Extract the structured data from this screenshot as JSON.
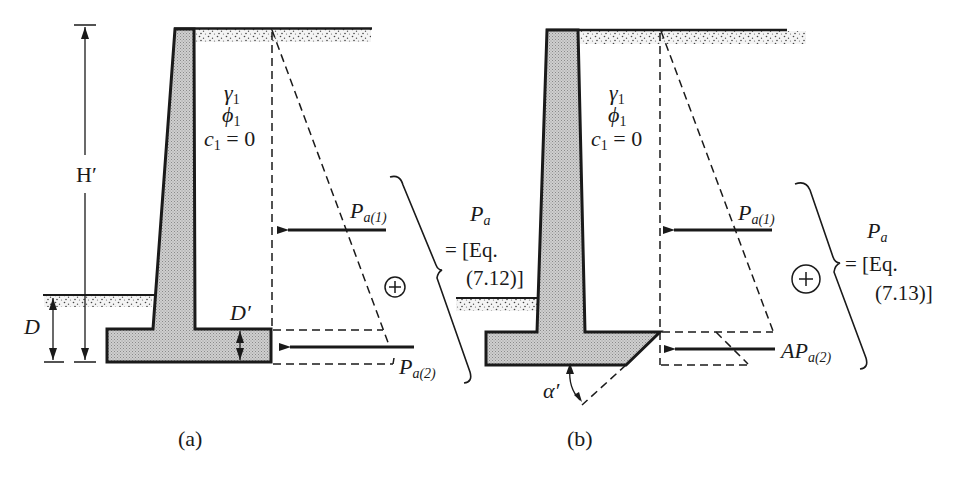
{
  "figure": {
    "panels": [
      {
        "id": "a",
        "caption": "(a)",
        "soil": {
          "gamma": "γ",
          "gamma_sub": "1",
          "phi": "ϕ",
          "phi_sub": "1",
          "c": "c",
          "c_sub": "1",
          "c_value": "= 0"
        },
        "dimensions": {
          "height": "H′",
          "depth": "D",
          "footing_thickness": "D′"
        },
        "forces": [
          {
            "label": "P",
            "sub": "a(1)"
          },
          {
            "label": "P",
            "sub": "a(2)"
          }
        ],
        "sum_symbol": "+",
        "result": {
          "label": "P",
          "sub": "a",
          "eq_line1": "= [Eq.",
          "eq_line2": "(7.12)]"
        }
      },
      {
        "id": "b",
        "caption": "(b)",
        "soil": {
          "gamma": "γ",
          "gamma_sub": "1",
          "phi": "ϕ",
          "phi_sub": "1",
          "c": "c",
          "c_sub": "1",
          "c_value": "= 0"
        },
        "angle": "α′",
        "forces": [
          {
            "label": "P",
            "sub": "a(1)"
          },
          {
            "prefix": "A",
            "label": "P",
            "sub": "a(2)"
          }
        ],
        "sum_symbol": "+",
        "result": {
          "label": "P",
          "sub": "a",
          "eq_line1": "= [Eq.",
          "eq_line2": "(7.13)]"
        }
      }
    ],
    "colors": {
      "ink": "#1a1a1a",
      "concrete": "#b8b8b8",
      "stipple": "#555555",
      "paper": "#ffffff"
    }
  }
}
